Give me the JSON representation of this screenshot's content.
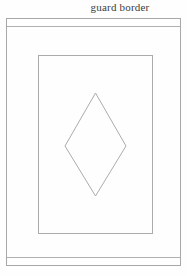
{
  "figure": {
    "title": "guard border",
    "colors": {
      "background": "#fefefe",
      "line": "#a8a8a8",
      "text": "#3c3c3c"
    }
  }
}
